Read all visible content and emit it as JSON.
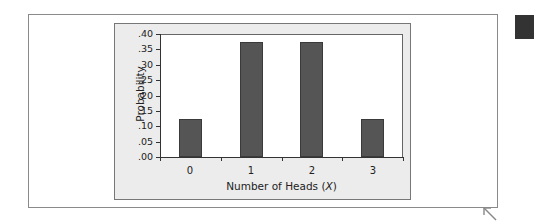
{
  "chart_data": {
    "type": "bar",
    "title": "",
    "xlabel": "Number of Heads",
    "xlabel_var": "X",
    "ylabel": "Probability",
    "categories": [
      "0",
      "1",
      "2",
      "3"
    ],
    "values": [
      0.125,
      0.375,
      0.375,
      0.125
    ],
    "ylim": [
      0,
      0.4
    ],
    "yticks": [
      ".00",
      ".05",
      ".10",
      ".15",
      ".20",
      ".25",
      ".30",
      ".35",
      ".40"
    ],
    "grid": false,
    "legend": null,
    "bar_color": "#555555",
    "panel_background": "#ececec"
  },
  "labels": {
    "xlabel_prefix": "Number of Heads (",
    "xlabel_var": "X",
    "xlabel_suffix": ")",
    "ylabel": "Probability"
  }
}
